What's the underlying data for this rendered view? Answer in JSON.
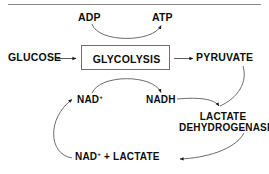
{
  "diagram": {
    "nodes": {
      "glucose": "GLUCOSE",
      "adp": "ADP",
      "atp": "ATP",
      "glycolysis": "GLYCOLYSIS",
      "pyruvate": "PYRUVATE",
      "nad_plus_base": "NAD",
      "nad_plus_charge": "+",
      "nadh": "NADH",
      "lactate_dehydrogenase_line1": "LACTATE",
      "lactate_dehydrogenase_line2": "DEHYDROGENASE",
      "bottom_nad_base": "NAD",
      "bottom_nad_charge": "+",
      "bottom_rest": " + LACTATE"
    },
    "edges": [
      {
        "from": "GLUCOSE",
        "to": "GLYCOLYSIS",
        "style": "straight-arrow"
      },
      {
        "from": "GLYCOLYSIS",
        "to": "PYRUVATE",
        "style": "straight-arrow"
      },
      {
        "from": "ADP",
        "to": "ATP",
        "style": "curved-arc-down"
      },
      {
        "from": "NAD+",
        "to": "NADH",
        "style": "curved-arc-up"
      },
      {
        "from": "PYRUVATE",
        "to": "LACTATE DEHYDROGENASE",
        "style": "curved-arc"
      },
      {
        "from": "NADH",
        "to": "LACTATE DEHYDROGENASE",
        "style": "curved-arc"
      },
      {
        "from": "LACTATE DEHYDROGENASE",
        "to": "NAD+ + LACTATE",
        "style": "curved-arc"
      },
      {
        "from": "NAD+ + LACTATE",
        "to": "NAD+",
        "style": "curved-arc-loop"
      }
    ],
    "colors": {
      "text": "#0d0d0d",
      "stroke": "#5a5a5a",
      "box_border": "#6f6f6f",
      "rule": "#8a8a8a",
      "background": "#ffffff"
    }
  }
}
